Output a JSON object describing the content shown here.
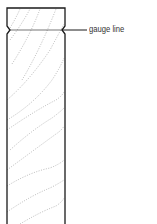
{
  "diagram": {
    "title": "",
    "labels": {
      "gauge_line": "gauge line"
    },
    "colors": {
      "outline": "#1a1a1a",
      "grain": "#888888",
      "text": "#333333"
    }
  }
}
